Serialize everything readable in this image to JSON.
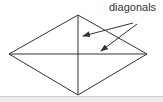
{
  "diagram": {
    "label": "diagonals",
    "shape": "rhombus",
    "vertices": {
      "top": [
        78,
        15
      ],
      "right": [
        147,
        54
      ],
      "bottom": [
        78,
        95
      ],
      "left": [
        9,
        54
      ]
    },
    "diagonals": [
      {
        "from": "top",
        "to": "bottom"
      },
      {
        "from": "left",
        "to": "right"
      }
    ],
    "arrows": [
      {
        "from": [
          133,
          23
        ],
        "to": [
          83,
          36
        ]
      },
      {
        "from": [
          137,
          24
        ],
        "to": [
          101,
          51
        ]
      }
    ],
    "colors": {
      "stroke": "#333333",
      "text": "#333333",
      "background": "#ffffff"
    }
  }
}
